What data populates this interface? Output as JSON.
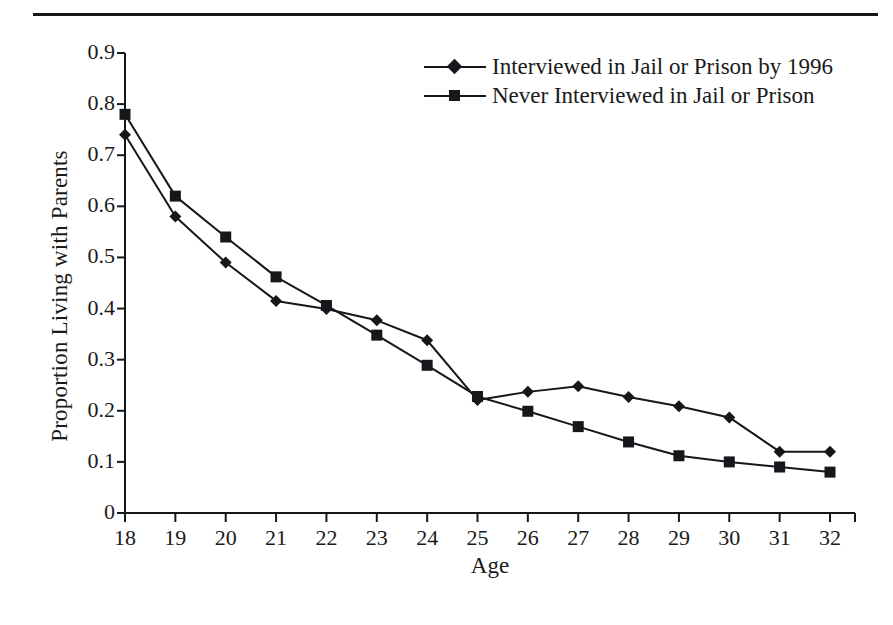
{
  "figure": {
    "has_top_rule": true,
    "background_color": "#ffffff",
    "ink_color": "#15171a"
  },
  "chart_data": {
    "type": "line",
    "title": "",
    "xlabel": "Age",
    "ylabel": "Proportion Living with Parents",
    "x": [
      18,
      19,
      20,
      21,
      22,
      23,
      24,
      25,
      26,
      27,
      28,
      29,
      30,
      31,
      32
    ],
    "categories": [
      "18",
      "19",
      "20",
      "21",
      "22",
      "23",
      "24",
      "25",
      "26",
      "27",
      "28",
      "29",
      "30",
      "31",
      "32"
    ],
    "xlim": [
      18,
      32
    ],
    "ylim": [
      0,
      0.9
    ],
    "yticks": [
      0,
      0.1,
      0.2,
      0.3,
      0.4,
      0.5,
      0.6,
      0.7,
      0.8,
      0.9
    ],
    "ytick_labels": [
      "0",
      "0.1",
      "0.2",
      "0.3",
      "0.4",
      "0.5",
      "0.6",
      "0.7",
      "0.8",
      "0.9"
    ],
    "xticks": [
      18,
      19,
      20,
      21,
      22,
      23,
      24,
      25,
      26,
      27,
      28,
      29,
      30,
      31,
      32
    ],
    "xtick_labels": [
      "18",
      "19",
      "20",
      "21",
      "22",
      "23",
      "24",
      "25",
      "26",
      "27",
      "28",
      "29",
      "30",
      "31",
      "32"
    ],
    "grid": false,
    "legend_position": "top-right-inside",
    "series": [
      {
        "name": "Interviewed in Jail or Prison by 1996",
        "marker": "diamond",
        "color": "#15171a",
        "values": [
          0.74,
          0.58,
          0.49,
          0.415,
          0.399,
          0.377,
          0.338,
          0.221,
          0.237,
          0.248,
          0.227,
          0.209,
          0.187,
          0.12,
          0.12
        ]
      },
      {
        "name": "Never Interviewed in Jail or Prison",
        "marker": "square",
        "color": "#15171a",
        "values": [
          0.78,
          0.62,
          0.54,
          0.462,
          0.406,
          0.348,
          0.289,
          0.228,
          0.199,
          0.169,
          0.139,
          0.112,
          0.1,
          0.09,
          0.08
        ]
      }
    ]
  },
  "legend": {
    "entries": [
      {
        "label": "Interviewed in Jail or Prison by 1996",
        "marker": "diamond"
      },
      {
        "label": "Never Interviewed in Jail or Prison",
        "marker": "square"
      }
    ]
  }
}
